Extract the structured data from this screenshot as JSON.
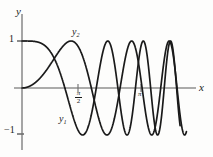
{
  "figure": {
    "kind": "math-graph",
    "background": "#fdfdfc",
    "axis_color": "#8a8a8a",
    "curve_color": "#1a1a1a"
  },
  "axes": {
    "x_label": "x",
    "y_label": "y",
    "y_ticks": [
      {
        "value": 1,
        "label": "1"
      },
      {
        "value": -1,
        "label": "−1"
      }
    ],
    "x_ticks": [
      {
        "value": 1.5708,
        "label_num": "π",
        "label_den": "2"
      },
      {
        "value": 3.1416,
        "label": "π"
      }
    ],
    "xlim": [
      -0.35,
      8.2
    ],
    "ylim": [
      -1.45,
      1.6
    ],
    "grid": false
  },
  "curves": [
    {
      "name": "y1",
      "label": "y₁",
      "label_sub": "1",
      "label_base": "y",
      "description": "chirp starting at 1, cosine-like, increasing frequency"
    },
    {
      "name": "y2",
      "label": "y₂",
      "label_sub": "2",
      "label_base": "y",
      "description": "chirp starting at 0, sine-like, increasing frequency"
    }
  ],
  "chart_data": {
    "type": "line",
    "title": "",
    "xlabel": "x",
    "ylabel": "y",
    "xlim": [
      -0.35,
      8.2
    ],
    "ylim": [
      -1.45,
      1.6
    ],
    "grid": false,
    "legend": "inline-labels",
    "xticks": [
      1.5708,
      3.1416
    ],
    "xticklabels": [
      "π/2",
      "π"
    ],
    "yticks": [
      -1,
      1
    ],
    "yticklabels": [
      "−1",
      "1"
    ],
    "series": [
      {
        "name": "y1",
        "formula": "cos(x^2/2.6)",
        "color": "#1a1a1a",
        "label_x": 1.35,
        "label_y": -1.15
      },
      {
        "name": "y2",
        "formula": "sin(x^2/3.4)",
        "color": "#1a1a1a",
        "label_x": 1.9,
        "label_y": 1.25
      }
    ],
    "annotations": [
      {
        "text": "y₁",
        "x": 1.35,
        "y": -1.15
      },
      {
        "text": "y₂",
        "x": 1.9,
        "y": 1.25
      }
    ]
  }
}
